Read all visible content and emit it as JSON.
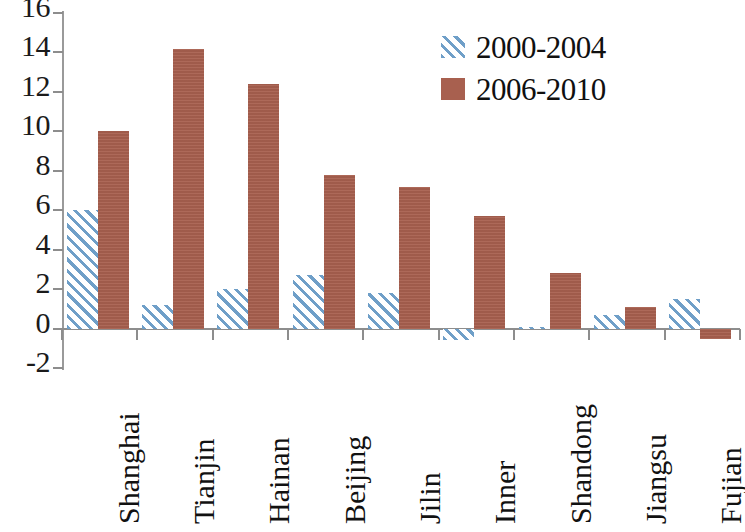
{
  "chart_data": {
    "type": "bar",
    "title": "",
    "subtitle": "",
    "xlabel": "",
    "ylabel": "",
    "ylim": [
      -2,
      16
    ],
    "ytick_step": 2,
    "yticks": [
      "16",
      "14",
      "12",
      "10",
      "8",
      "6",
      "4",
      "2",
      "0",
      "-2"
    ],
    "ytick_values": [
      16,
      14,
      12,
      10,
      8,
      6,
      4,
      2,
      0,
      -2
    ],
    "grid": false,
    "legend_position": "top-right",
    "categories": [
      "Shanghai",
      "Tianjin",
      "Hainan",
      "Beijing",
      "Jilin",
      "Inner",
      "Shandong",
      "Jiangsu",
      "Fujian"
    ],
    "series": [
      {
        "name": "2000-2004",
        "color": "#6f9fc8",
        "fill": "hatched-diagonal",
        "values": [
          6.0,
          1.2,
          2.0,
          2.7,
          1.8,
          -0.6,
          0.1,
          0.7,
          1.5
        ]
      },
      {
        "name": "2006-2010",
        "color": "#a8604f",
        "fill": "solid",
        "values": [
          10.0,
          14.2,
          12.4,
          7.8,
          7.2,
          5.7,
          2.8,
          1.1,
          -0.55
        ]
      }
    ]
  },
  "legend": {
    "items": [
      {
        "label": "2000-2004",
        "swatch": "blue-hatched"
      },
      {
        "label": "2006-2010",
        "swatch": "red-solid"
      }
    ]
  },
  "colors": {
    "series_2000_2004": "#6f9fc8",
    "series_2006_2010": "#a8604f",
    "axis": "#8d8d8d",
    "text": "#111111",
    "background": "#ffffff"
  }
}
